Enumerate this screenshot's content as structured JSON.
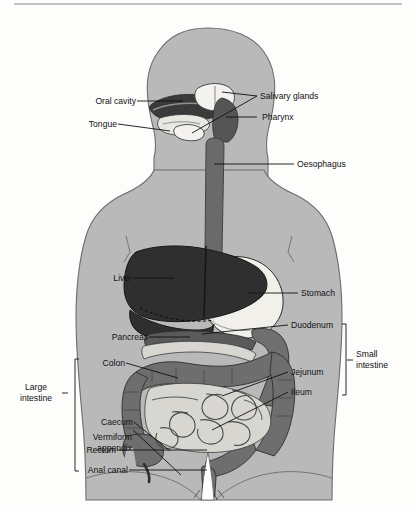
{
  "figure": {
    "type": "anatomical-diagram",
    "canvas": {
      "width": 416,
      "height": 510
    },
    "colors": {
      "background": "#fdfdfc",
      "body_silhouette": "#b9b9b9",
      "body_outline": "#6d6d6d",
      "liver": "#2f2f2f",
      "stomach": "#f2f0eb",
      "oesophagus": "#6a6a6a",
      "pharynx": "#555555",
      "oral_cavity": "#3a3a3a",
      "tongue": "#e9e7e2",
      "salivary_glands": "#f4f2ee",
      "duodenum": "#6f6f6f",
      "pancreas": "#5a5a5a",
      "colon": "#6e6e6e",
      "small_intestine_coils": "#d8d6d1",
      "leader_line": "#111111",
      "label_text": "#111111"
    }
  },
  "labels": {
    "left": [
      {
        "id": "oral-cavity",
        "text": "Oral cavity"
      },
      {
        "id": "tongue",
        "text": "Tongue"
      },
      {
        "id": "liver",
        "text": "Liver"
      },
      {
        "id": "pancreas",
        "text": "Pancreas"
      },
      {
        "id": "colon",
        "text": "Colon"
      },
      {
        "id": "caecum",
        "text": "Caecum"
      },
      {
        "id": "vermiform-appendix-line1",
        "text": "Vermiform"
      },
      {
        "id": "vermiform-appendix-line2",
        "text": "appendix"
      },
      {
        "id": "rectum",
        "text": "Rectum"
      },
      {
        "id": "anal-canal",
        "text": "Anal canal"
      }
    ],
    "right": [
      {
        "id": "salivary-glands",
        "text": "Salivary glands"
      },
      {
        "id": "pharynx",
        "text": "Pharynx"
      },
      {
        "id": "oesophagus",
        "text": "Oesophagus"
      },
      {
        "id": "stomach",
        "text": "Stomach"
      },
      {
        "id": "duodenum",
        "text": "Duodenum"
      },
      {
        "id": "jejunum",
        "text": "Jejunum"
      },
      {
        "id": "ileum",
        "text": "Ileum"
      }
    ],
    "groups": [
      {
        "id": "large-intestine",
        "line1": "Large",
        "line2": "intestine",
        "side": "left"
      },
      {
        "id": "small-intestine",
        "line1": "Small",
        "line2": "intestine",
        "side": "right"
      }
    ]
  }
}
